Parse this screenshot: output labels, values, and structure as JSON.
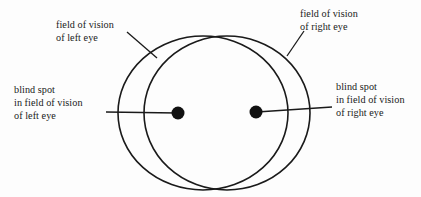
{
  "figure": {
    "background_color": "#fdfdfd",
    "stroke_color": "#1a1a1a",
    "text_color": "#1a1a1a"
  },
  "labels": {
    "fov_left": {
      "line1": "field of vision",
      "line2": "of left eye"
    },
    "fov_right": {
      "line1": "field of vision",
      "line2": "of right eye"
    },
    "blind_left": {
      "line1": "blind spot",
      "line2": "in field of vision",
      "line3": "of left eye"
    },
    "blind_right": {
      "line1": "blind spot",
      "line2": "in field of vision",
      "line3": "of right eye"
    }
  },
  "shapes": {
    "left_circle": {
      "cx": 203,
      "cy": 113,
      "rx": 85,
      "ry": 77
    },
    "right_circle": {
      "cx": 227,
      "cy": 113,
      "rx": 83,
      "ry": 77
    },
    "left_blind_spot": {
      "cx": 178,
      "cy": 113,
      "r": 6.5
    },
    "right_blind_spot": {
      "cx": 256,
      "cy": 112,
      "r": 6.5
    }
  }
}
